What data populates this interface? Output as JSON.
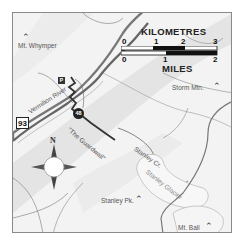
{
  "map": {
    "peaks": [
      {
        "name": "Mt. Whymper"
      },
      {
        "name": "Storm Mtn."
      },
      {
        "name": "Stanley Pk."
      },
      {
        "name": "Mt. Ball"
      }
    ],
    "water": {
      "river": "Vermilion River",
      "creek": "Stanley Cr.",
      "glacier": "Stanley Glacier"
    },
    "trail_label": "\"The Guardwall\"",
    "highway_shield": "93",
    "parking_symbol": "P",
    "trail_marker": "48",
    "compass": {
      "north_label": "N"
    },
    "scale_bar": {
      "km_title": "KILOMETRES",
      "km_ticks": [
        "0",
        "1",
        "2",
        "3"
      ],
      "miles_title": "MILES",
      "mile_ticks": [
        "0",
        "1",
        "2"
      ]
    },
    "colors": {
      "background": "#f3f3f3",
      "valley_band": "#e2e2e2",
      "road": "#777777",
      "trail": "#333333",
      "border": "#8a8a8a"
    }
  }
}
